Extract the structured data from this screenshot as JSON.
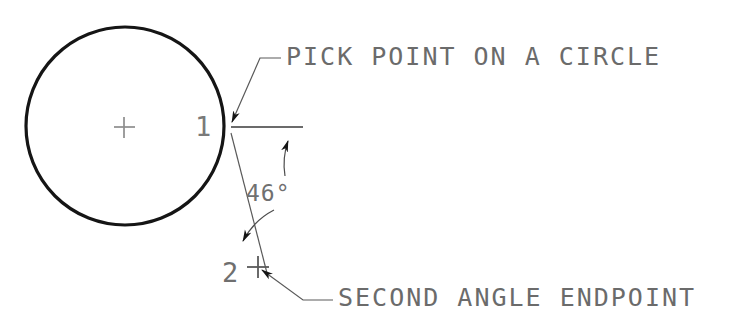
{
  "diagram": {
    "background_color": "#ffffff",
    "ink_color": "#1a1a1a",
    "text_color": "#6b6b6b",
    "annotations": {
      "pick_point_label": "PICK POINT ON A CIRCLE",
      "second_endpoint_label": "SECOND ANGLE ENDPOINT",
      "angle_value": "46°",
      "point_one_number": "1",
      "point_two_number": "2"
    },
    "geometry": {
      "circle": {
        "center_x": 125,
        "center_y": 126,
        "radius": 99,
        "stroke_width": 3
      },
      "center_mark": {
        "x": 124,
        "y": 127,
        "size": 20
      },
      "pick_point_one": {
        "x": 229,
        "y": 126
      },
      "pick_point_two": {
        "x": 258,
        "y": 267
      },
      "datum_line": {
        "x1": 231,
        "y1": 127,
        "x2": 303,
        "y2": 127
      },
      "angle_degrees": 46,
      "arc_radius": 72
    }
  }
}
